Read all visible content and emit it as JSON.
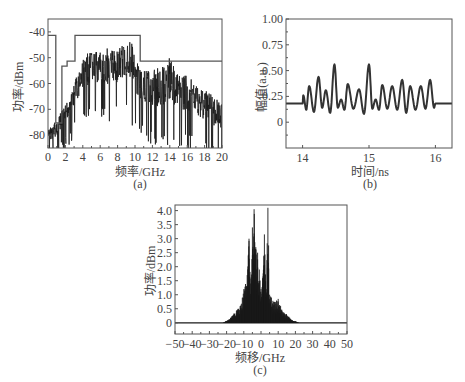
{
  "chart_data": [
    {
      "id": "a",
      "type": "line",
      "panel_label": "(a)",
      "title": "",
      "xlabel": "频率/GHz",
      "ylabel": "功率/dBm",
      "xlim": [
        0,
        20
      ],
      "ylim": [
        -85,
        -35
      ],
      "xticks": [
        "0",
        "2",
        "4",
        "6",
        "8",
        "10",
        "12",
        "14",
        "16",
        "18",
        "20"
      ],
      "yticks": [
        "-40",
        "-50",
        "-60",
        "-70",
        "-80"
      ],
      "grid": false,
      "series": [
        {
          "name": "spectrum",
          "description": "noisy broadband spectrum, peak ~-42 dBm near 9.3 GHz",
          "envelope_x": [
            0,
            1,
            2,
            3,
            4,
            5,
            6,
            7,
            8,
            9,
            9.5,
            10,
            11,
            12,
            13,
            14,
            15,
            16,
            17,
            18,
            19,
            20
          ],
          "envelope_top": [
            -78,
            -74,
            -68,
            -60,
            -50,
            -47,
            -48,
            -46,
            -47,
            -44,
            -42,
            -50,
            -55,
            -55,
            -53,
            -50,
            -57,
            -57,
            -60,
            -62,
            -65,
            -68
          ],
          "envelope_bottom": [
            -85,
            -85,
            -80,
            -75,
            -70,
            -68,
            -68,
            -70,
            -68,
            -66,
            -70,
            -74,
            -76,
            -78,
            -80,
            -78,
            -78,
            -80,
            -80,
            -82,
            -84,
            -85
          ]
        },
        {
          "name": "mask",
          "type": "step",
          "x": [
            0,
            0.9,
            0.9,
            1.6,
            1.6,
            2.2,
            2.2,
            3.1,
            3.1,
            10.6,
            10.6,
            20
          ],
          "y": [
            -41.3,
            -41.3,
            -75.3,
            -75.3,
            -53.3,
            -53.3,
            -51.3,
            -51.3,
            -41.3,
            -41.3,
            -51.3,
            -51.3
          ]
        }
      ]
    },
    {
      "id": "b",
      "type": "line",
      "panel_label": "(b)",
      "title": "",
      "xlabel": "时间/ns",
      "ylabel": "幅值(a.u.)",
      "xlim": [
        13.75,
        16.25
      ],
      "ylim": [
        -0.25,
        1.0
      ],
      "xticks": [
        "14",
        "15",
        "16"
      ],
      "yticks": [
        "1.00",
        "0.75",
        "0.50",
        "0.25",
        "0"
      ],
      "grid": false,
      "series": [
        {
          "name": "pulse",
          "baseline": 0.18,
          "peaks_x": [
            14.01,
            14.1,
            14.24,
            14.35,
            14.48,
            14.58,
            14.68,
            14.85,
            15.0,
            15.1,
            15.2,
            15.35,
            15.5,
            15.62,
            15.78,
            15.92
          ],
          "peaks_y": [
            0.26,
            0.35,
            0.44,
            0.31,
            0.56,
            0.22,
            0.37,
            0.32,
            0.56,
            0.22,
            0.36,
            0.35,
            0.41,
            0.35,
            0.35,
            0.41
          ],
          "troughs_y": [
            0.12,
            0.1,
            0.14,
            0.09,
            0.14,
            0.12,
            0.13,
            0.08,
            0.13,
            0.12,
            0.13,
            0.12,
            0.09,
            0.12,
            0.13
          ]
        }
      ]
    },
    {
      "id": "c",
      "type": "bar",
      "panel_label": "(c)",
      "title": "",
      "xlabel": "频移/GHz",
      "ylabel": "功率/dBm",
      "xlim": [
        -50,
        50
      ],
      "ylim": [
        -0.4,
        4.2
      ],
      "xticks": [
        "-50",
        "-40",
        "-30",
        "-20",
        "-10",
        "0",
        "10",
        "20",
        "30",
        "40",
        "50"
      ],
      "yticks": [
        "4.0",
        "3.5",
        "3.0",
        "2.5",
        "2.0",
        "1.5",
        "1.0",
        "0.5",
        "0"
      ],
      "grid": false,
      "series": [
        {
          "name": "shifted spectrum",
          "x": [
            -22,
            -18,
            -15,
            -12,
            -10,
            -8,
            -7,
            -6,
            -5,
            -4,
            -3,
            -2,
            -1,
            0,
            1,
            2,
            3,
            4,
            5,
            6,
            8,
            10,
            12,
            15,
            18,
            22
          ],
          "y": [
            0.0,
            0.15,
            0.4,
            0.6,
            1.2,
            1.7,
            3.0,
            1.4,
            3.4,
            4.05,
            2.7,
            2.5,
            1.9,
            1.2,
            1.6,
            3.15,
            1.2,
            4.1,
            1.0,
            0.9,
            0.75,
            0.85,
            0.5,
            0.3,
            0.1,
            0.0
          ]
        }
      ]
    }
  ],
  "labels": {
    "a": {
      "xlabel": "频率/GHz",
      "ylabel": "功率/dBm",
      "panel": "(a)"
    },
    "b": {
      "xlabel": "时间/ns",
      "ylabel": "幅值(a.u.)",
      "panel": "(b)"
    },
    "c": {
      "xlabel": "频移/GHz",
      "ylabel": "功率/dBm",
      "panel": "(c)"
    }
  },
  "colors": {
    "line": "#1a1a1a",
    "mask": "#555555",
    "axis": "#555555",
    "pulse": "#333333"
  }
}
